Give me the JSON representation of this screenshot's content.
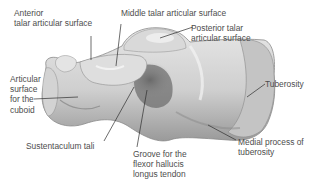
{
  "figure": {
    "title_partial": "",
    "colors": {
      "background": "#ffffff",
      "bone_light": "#e8e8e8",
      "bone_mid": "#b9b9b9",
      "bone_dark": "#6e6e6e",
      "leader_line": "#2e2e2e",
      "label_text": "#4d4d4d"
    }
  },
  "labels": {
    "anterior_talar": {
      "line1": "Anterior",
      "line2": "talar articular surface"
    },
    "middle_talar": {
      "line1": "Middle talar articular surface"
    },
    "posterior_talar": {
      "line1": "Posterior talar",
      "line2": "articular surface"
    },
    "cuboid": {
      "line1": "Articular",
      "line2": "surface",
      "line3": "for the",
      "line4": "cuboid"
    },
    "tuberosity": {
      "line1": "Tuberosity"
    },
    "sustentaculum": {
      "line1": "Sustentaculum tali"
    },
    "groove": {
      "line1": "Groove for the",
      "line2": "flexor hallucis",
      "line3": "longus tendon"
    },
    "medial_process": {
      "line1": "Medial process of",
      "line2": "tuberosity"
    }
  }
}
